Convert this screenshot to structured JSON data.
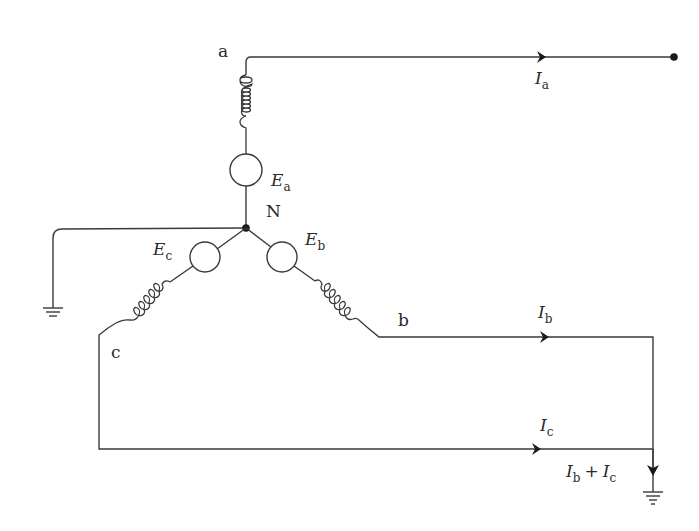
{
  "diagram": {
    "type": "three-phase wye-connected generator with grounded neutral",
    "nodes": {
      "a": "a",
      "b": "b",
      "c": "c",
      "neutral": "N"
    },
    "sources": {
      "ea": {
        "symbol": "E",
        "sub": "a"
      },
      "eb": {
        "symbol": "E",
        "sub": "b"
      },
      "ec": {
        "symbol": "E",
        "sub": "c"
      }
    },
    "currents": {
      "ia": {
        "symbol": "I",
        "sub": "a"
      },
      "ib": {
        "symbol": "I",
        "sub": "b"
      },
      "ic": {
        "symbol": "I",
        "sub": "c"
      },
      "isum": {
        "symbol1": "I",
        "sub1": "b",
        "op": "+",
        "symbol2": "I",
        "sub2": "c"
      }
    },
    "colors": {
      "line": "#3a3a3a",
      "background": "#ffffff"
    }
  }
}
